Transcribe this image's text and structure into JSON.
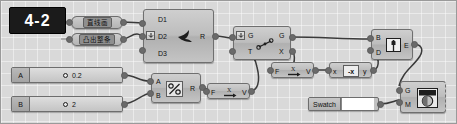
{
  "badge": {
    "text": "4-2"
  },
  "canvas": {
    "background": "#d9d9d9",
    "wire_color": "#3a3a3a",
    "node_fill": "#bdbdbd",
    "node_border": "#6f6f6f"
  },
  "params": [
    {
      "label": "直线画",
      "name": "curve-param"
    },
    {
      "label": "凸出整条",
      "name": "extrude-param"
    }
  ],
  "nodes": {
    "divide": {
      "inputs": [
        "D1",
        "D2",
        "D3"
      ],
      "outputs": [
        "R"
      ],
      "icon": "bird-icon"
    },
    "shatter": {
      "inputs": [
        "G",
        "T"
      ],
      "outputs": [
        "G",
        "X"
      ],
      "icon": "segment-icon"
    },
    "division": {
      "inputs": [
        "A",
        "B"
      ],
      "outputs": [
        "R"
      ],
      "icon": "percent-divide-icon"
    },
    "vector_lower": {
      "inputs": [
        "F"
      ],
      "outputs": [
        "V"
      ],
      "icon": "arrow-vector-icon"
    },
    "vector_upper": {
      "inputs": [
        "F"
      ],
      "outputs": [
        "V"
      ],
      "icon": "arrow-vector-icon"
    },
    "negate": {
      "inputs": [
        "x"
      ],
      "outputs": [
        "y"
      ],
      "icon": "negate-x-icon",
      "icon_label": "-x"
    },
    "extrude": {
      "inputs": [
        "B",
        "D"
      ],
      "outputs": [
        "E"
      ],
      "icon": "book-icon"
    },
    "render": {
      "inputs": [
        "G",
        "M"
      ],
      "outputs": [],
      "icon": "shaded-sphere-icon"
    }
  },
  "sliders": [
    {
      "name": "A",
      "value": "0.2"
    },
    {
      "name": "B",
      "value": "2"
    }
  ],
  "swatch": {
    "label": "Swatch",
    "color": "#ffffff"
  }
}
